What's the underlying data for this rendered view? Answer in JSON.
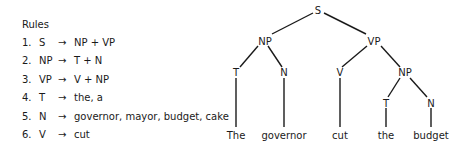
{
  "rules": {
    "title": "Rules",
    "items": [
      {
        "num": "1.",
        "lhs": "S",
        "arrow": "→",
        "rhs": "NP + VP"
      },
      {
        "num": "2.",
        "lhs": "NP",
        "arrow": "→",
        "rhs": "T + N"
      },
      {
        "num": "3.",
        "lhs": "VP",
        "arrow": "→",
        "rhs": "V + NP"
      },
      {
        "num": "4.",
        "lhs": "T",
        "arrow": "→",
        "rhs": "the, a"
      },
      {
        "num": "5.",
        "lhs": "N",
        "arrow": "→",
        "rhs": "governor, mayor, budget, cake"
      },
      {
        "num": "6.",
        "lhs": "V",
        "arrow": "→",
        "rhs": "cut"
      }
    ]
  },
  "tree": {
    "nodes": {
      "s": "S",
      "np1": "NP",
      "vp": "VP",
      "t1": "T",
      "n1": "N",
      "v": "V",
      "np2": "NP",
      "t2": "T",
      "n2": "N"
    },
    "leaves": {
      "the1": "The",
      "governor": "governor",
      "cut": "cut",
      "the2": "the",
      "budget": "budget"
    }
  },
  "colors": {
    "ink": "#1a1a1a",
    "background": "#ffffff"
  }
}
